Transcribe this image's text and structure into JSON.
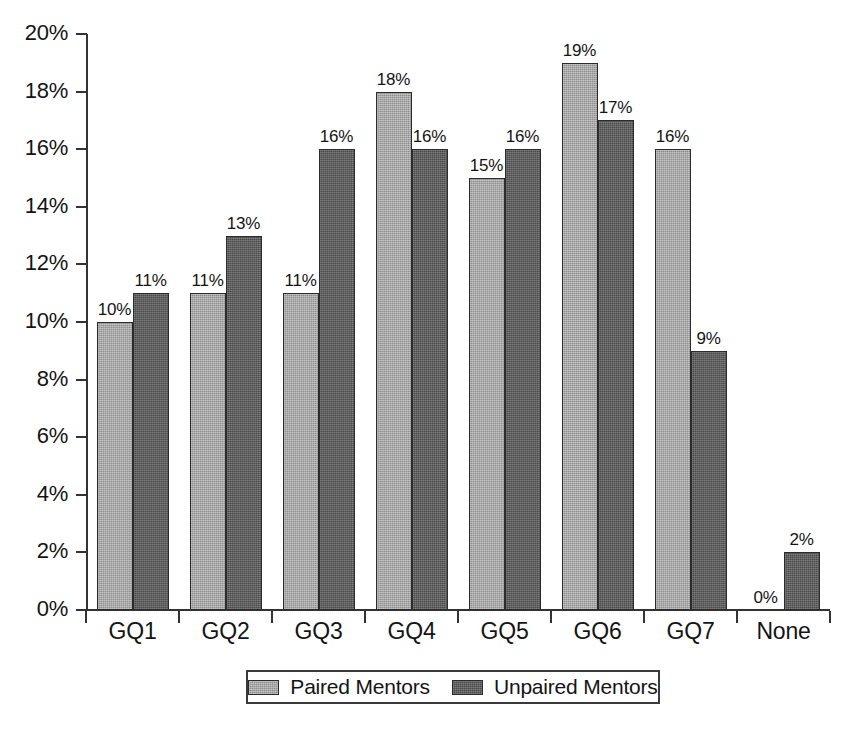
{
  "chart_data": {
    "type": "bar",
    "title": "",
    "subtitle": "",
    "xlabel": "",
    "ylabel": "",
    "categories": [
      "GQ1",
      "GQ2",
      "GQ3",
      "GQ4",
      "GQ5",
      "GQ6",
      "GQ7",
      "None"
    ],
    "series": [
      {
        "name": "Paired Mentors",
        "color": "#8f8f8f",
        "values": [
          10,
          11,
          11,
          18,
          15,
          19,
          16,
          0
        ],
        "labels": [
          "10%",
          "11%",
          "11%",
          "18%",
          "15%",
          "19%",
          "16%",
          "0%"
        ]
      },
      {
        "name": "Unpaired Mentors",
        "color": "#4a4a4a",
        "values": [
          11,
          13,
          16,
          16,
          16,
          17,
          9,
          2
        ],
        "labels": [
          "11%",
          "13%",
          "16%",
          "16%",
          "16%",
          "17%",
          "9%",
          "2%"
        ]
      }
    ],
    "ylim": [
      0,
      20
    ],
    "ytick_values": [
      0,
      2,
      4,
      6,
      8,
      10,
      12,
      14,
      16,
      18,
      20
    ],
    "ytick_labels": [
      "0%",
      "2%",
      "4%",
      "6%",
      "8%",
      "10%",
      "12%",
      "14%",
      "16%",
      "18%",
      "20%"
    ],
    "grid": false,
    "value_labels": true,
    "legend_position": "bottom"
  },
  "legend": {
    "entries": [
      {
        "label": "Paired Mentors",
        "swatch": "paired"
      },
      {
        "label": "Unpaired Mentors",
        "swatch": "unpaired"
      }
    ]
  }
}
